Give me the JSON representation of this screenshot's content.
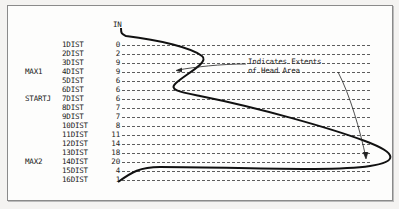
{
  "diagram": {
    "column_header": "IN",
    "rows": [
      {
        "label": "1DIST",
        "value": "0",
        "side": ""
      },
      {
        "label": "2DIST",
        "value": "2",
        "side": ""
      },
      {
        "label": "3DIST",
        "value": "9",
        "side": ""
      },
      {
        "label": "4DIST",
        "value": "9",
        "side": "MAX1"
      },
      {
        "label": "5DIST",
        "value": "6",
        "side": ""
      },
      {
        "label": "6DIST",
        "value": "6",
        "side": ""
      },
      {
        "label": "7DIST",
        "value": "6",
        "side": "STARTJ"
      },
      {
        "label": "8DIST",
        "value": "7",
        "side": ""
      },
      {
        "label": "9DIST",
        "value": "7",
        "side": ""
      },
      {
        "label": "10DIST",
        "value": "8",
        "side": ""
      },
      {
        "label": "11DIST",
        "value": "11",
        "side": ""
      },
      {
        "label": "12DIST",
        "value": "14",
        "side": ""
      },
      {
        "label": "13DIST",
        "value": "18",
        "side": ""
      },
      {
        "label": "14DIST",
        "value": "20",
        "side": "MAX2"
      },
      {
        "label": "15DIST",
        "value": "4",
        "side": ""
      },
      {
        "label": "16DIST",
        "value": "1",
        "side": ""
      }
    ],
    "annotation": {
      "line1": "Indicates Extents",
      "line2": "of Head Area"
    }
  }
}
